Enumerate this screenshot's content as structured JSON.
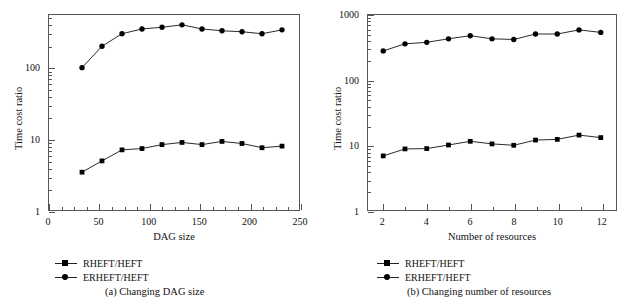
{
  "figure": {
    "panels": [
      {
        "id": "panel-a",
        "caption": "(a)  Changing DAG size",
        "xtitle": "DAG size",
        "ytitle": "Time cost ratio",
        "xticks": [
          "0",
          "50",
          "100",
          "150",
          "200",
          "250"
        ],
        "yticks": [
          "1",
          "10",
          "100"
        ],
        "legend": [
          {
            "label": "RHEFT/HEFT",
            "marker": "square"
          },
          {
            "label": "ERHEFT/HEFT",
            "marker": "circle"
          }
        ]
      },
      {
        "id": "panel-b",
        "caption": "(b)  Changing number of resources",
        "xtitle": "Number of resources",
        "ytitle": "Time cost ratio",
        "xticks": [
          "2",
          "4",
          "6",
          "8",
          "10",
          "12"
        ],
        "yticks": [
          "1",
          "10",
          "100",
          "1000"
        ],
        "legend": [
          {
            "label": "RHEFT/HEFT",
            "marker": "square"
          },
          {
            "label": "ERHEFT/HEFT",
            "marker": "circle"
          }
        ]
      }
    ]
  },
  "chart_data": [
    {
      "type": "line",
      "title": "(a)  Changing DAG size",
      "xlabel": "DAG size",
      "ylabel": "Time cost ratio",
      "yscale": "log",
      "xlim": [
        0,
        250
      ],
      "ylim": [
        1,
        550
      ],
      "grid": false,
      "legend_position": "below-left",
      "x": [
        33,
        53,
        73,
        93,
        113,
        133,
        153,
        173,
        193,
        213,
        233
      ],
      "series": [
        {
          "name": "RHEFT/HEFT",
          "marker": "square",
          "values": [
            3.4,
            4.9,
            7.0,
            7.3,
            8.3,
            8.9,
            8.3,
            9.2,
            8.6,
            7.5,
            7.9
          ]
        },
        {
          "name": "ERHEFT/HEFT",
          "marker": "circle",
          "values": [
            100,
            200,
            300,
            350,
            370,
            400,
            350,
            330,
            320,
            300,
            340
          ]
        }
      ]
    },
    {
      "type": "line",
      "title": "(b)  Changing number of resources",
      "xlabel": "Number of resources",
      "ylabel": "Time cost ratio",
      "yscale": "log",
      "xlim": [
        1.3,
        12.7
      ],
      "ylim": [
        1,
        1000
      ],
      "grid": false,
      "legend_position": "below-left",
      "x": [
        2,
        3,
        4,
        5,
        6,
        7,
        8,
        9,
        10,
        11,
        12
      ],
      "series": [
        {
          "name": "RHEFT/HEFT",
          "marker": "square",
          "values": [
            6.8,
            8.7,
            8.8,
            10.0,
            11.4,
            10.4,
            9.9,
            11.9,
            12.2,
            14.2,
            13.0
          ]
        },
        {
          "name": "ERHEFT/HEFT",
          "marker": "circle",
          "values": [
            280,
            360,
            380,
            430,
            480,
            430,
            420,
            510,
            510,
            590,
            540
          ]
        }
      ]
    }
  ]
}
